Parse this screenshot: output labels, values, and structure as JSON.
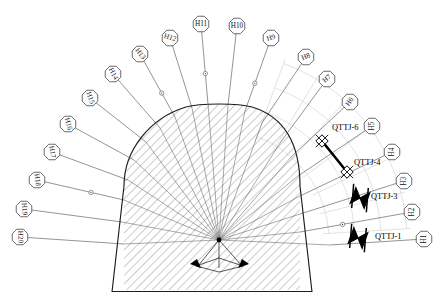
{
  "diagram": {
    "type": "engineering-cross-section",
    "background_color": "#ffffff",
    "line_color": "#2a2a2a",
    "grid_color": "#c9c9c9",
    "hatch_color": "#6a6a6a",
    "instrument_color": "#000000"
  },
  "tunnel": {
    "name": "tunnel-cross-section",
    "outline_color": "#1d1d1d",
    "hatch_pattern": "45-degree-diagonal",
    "station_point": {
      "x": 219,
      "y": 240,
      "label": ""
    }
  },
  "polar_grid": {
    "name": "polar-reference-grid",
    "color": "#cfcfcf",
    "arc_count": 4,
    "ray_count": 6
  },
  "measurement_lines": {
    "count": 20,
    "origin": {
      "x": 219,
      "y": 240
    },
    "items": [
      {
        "label": "H1",
        "lx": 424,
        "ly": 239,
        "ex": 330,
        "ey": 245,
        "rot": -90,
        "marker": false
      },
      {
        "label": "H2",
        "lx": 412,
        "ly": 212,
        "ex": 300,
        "ey": 232,
        "rot": -90,
        "marker": true
      },
      {
        "label": "H3",
        "lx": 404,
        "ly": 181,
        "ex": 300,
        "ey": 214,
        "rot": -90,
        "marker": false
      },
      {
        "label": "H4",
        "lx": 392,
        "ly": 152,
        "ex": 300,
        "ey": 196,
        "rot": -90,
        "marker": false
      },
      {
        "label": "H5",
        "lx": 372,
        "ly": 126,
        "ex": 298,
        "ey": 176,
        "rot": -90,
        "marker": false
      },
      {
        "label": "H6",
        "lx": 350,
        "ly": 102,
        "ex": 292,
        "ey": 156,
        "rot": -55,
        "marker": false
      },
      {
        "label": "H7",
        "lx": 327,
        "ly": 79,
        "ex": 280,
        "ey": 143,
        "rot": -40,
        "marker": false
      },
      {
        "label": "H8",
        "lx": 306,
        "ly": 57,
        "ex": 262,
        "ey": 123,
        "rot": -22,
        "marker": false
      },
      {
        "label": "H9",
        "lx": 271,
        "ly": 38,
        "ex": 245,
        "ey": 111,
        "rot": -15,
        "marker": true
      },
      {
        "label": "H10",
        "lx": 237,
        "ly": 26,
        "ex": 228,
        "ey": 105,
        "rot": 0,
        "marker": false
      },
      {
        "label": "H11",
        "lx": 201,
        "ly": 24,
        "ex": 208,
        "ey": 104,
        "rot": 0,
        "marker": true
      },
      {
        "label": "H12",
        "lx": 170,
        "ly": 38,
        "ex": 192,
        "ey": 108,
        "rot": 18,
        "marker": false
      },
      {
        "label": "H13",
        "lx": 140,
        "ly": 54,
        "ex": 175,
        "ey": 117,
        "rot": 52,
        "marker": true
      },
      {
        "label": "H14",
        "lx": 113,
        "ly": 74,
        "ex": 160,
        "ey": 128,
        "rot": 62,
        "marker": false
      },
      {
        "label": "H15",
        "lx": 90,
        "ly": 98,
        "ex": 146,
        "ey": 142,
        "rot": 70,
        "marker": false
      },
      {
        "label": "H16",
        "lx": 68,
        "ly": 124,
        "ex": 134,
        "ey": 160,
        "rot": 74,
        "marker": false
      },
      {
        "label": "H17",
        "lx": 52,
        "ly": 152,
        "ex": 128,
        "ey": 180,
        "rot": 80,
        "marker": false
      },
      {
        "label": "H18",
        "lx": 37,
        "ly": 180,
        "ex": 124,
        "ey": 200,
        "rot": 82,
        "marker": true
      },
      {
        "label": "H19",
        "lx": 24,
        "ly": 209,
        "ex": 122,
        "ey": 222,
        "rot": 86,
        "marker": false
      },
      {
        "label": "H20",
        "lx": 20,
        "ly": 237,
        "ex": 124,
        "ey": 244,
        "rot": 88,
        "marker": false
      }
    ]
  },
  "instruments": {
    "name": "convergence-instruments",
    "items": [
      {
        "label": "QTTJ-6",
        "x": 322,
        "y": 141,
        "tx": 332,
        "ty": 128,
        "symbol": "diamond-node",
        "rot": 0
      },
      {
        "label": "QTTJ-4",
        "x": 347,
        "y": 172,
        "tx": 354,
        "ty": 163,
        "symbol": "diamond-node",
        "rot": 0
      },
      {
        "label": "QTTJ-3",
        "x": 360,
        "y": 198,
        "tx": 371,
        "ty": 197,
        "symbol": "anchor-bowtie",
        "rot": 20
      },
      {
        "label": "QTTJ-1",
        "x": 358,
        "y": 238,
        "tx": 375,
        "ty": 237,
        "symbol": "anchor-bowtie",
        "rot": 20
      }
    ],
    "connector": {
      "from": "QTTJ-6",
      "to": "QTTJ-4",
      "style": "thick-rod"
    }
  }
}
